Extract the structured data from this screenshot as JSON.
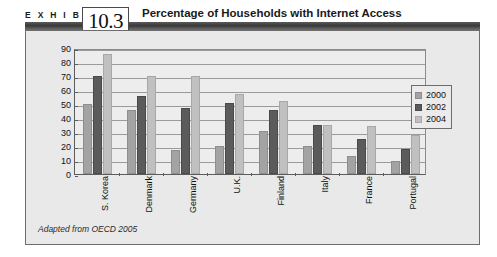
{
  "header": {
    "exhibit_word": "E X H I B I T",
    "exhibit_number": "10.3",
    "title": "Percentage of Households with Internet Access"
  },
  "source_note": "Adapted from OECD 2005",
  "legend": {
    "position": "right",
    "entries": [
      {
        "label": "2000",
        "color": "#a3a3a3"
      },
      {
        "label": "2002",
        "color": "#5b5b5b"
      },
      {
        "label": "2004",
        "color": "#c0c0c0"
      }
    ]
  },
  "chart_data": {
    "type": "bar",
    "title": "Percentage of Households with Internet Access",
    "xlabel": "",
    "ylabel": "",
    "ylim": [
      0,
      90
    ],
    "ytick_step": 10,
    "yticks": [
      0,
      10,
      20,
      30,
      40,
      50,
      60,
      70,
      80,
      90
    ],
    "grid": true,
    "grid_axis": "y",
    "legend_position": "right",
    "categories": [
      "S. Korea",
      "Denmark",
      "Germany",
      "U.K.",
      "Finland",
      "Italy",
      "France",
      "Portugal"
    ],
    "series": [
      {
        "name": "2000",
        "color": "#a3a3a3",
        "values": [
          50,
          46,
          17,
          20,
          31,
          20,
          13,
          9
        ]
      },
      {
        "name": "2002",
        "color": "#5b5b5b",
        "values": [
          70,
          56,
          47,
          51,
          46,
          35,
          25,
          18
        ]
      },
      {
        "name": "2004",
        "color": "#c0c0c0",
        "values": [
          86,
          70,
          70,
          57,
          52,
          35,
          34,
          28
        ]
      }
    ],
    "source": "Adapted from OECD 2005"
  }
}
